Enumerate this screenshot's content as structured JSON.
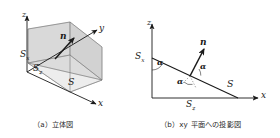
{
  "figure": {
    "type": "technical-diagram",
    "background_color": "#ffffff",
    "line_color": "#1a1a1a",
    "shade_color": "#d8d8d8",
    "panels": [
      {
        "id": "panel-a",
        "caption": "（a）立体図",
        "caption_label": "(a)",
        "caption_text": "立体図",
        "axes": [
          {
            "name": "x-axis",
            "label": "x"
          },
          {
            "name": "y-axis",
            "label": "y"
          },
          {
            "name": "z-axis",
            "label": "z"
          }
        ],
        "vectors": [
          {
            "name": "normal-vector",
            "label": "n"
          }
        ],
        "surfaces": [
          {
            "name": "surface-S",
            "label": "S"
          },
          {
            "name": "surface-Sx",
            "label": "S",
            "sub": "x"
          },
          {
            "name": "surface-Sz",
            "label": "S",
            "sub": "z"
          }
        ]
      },
      {
        "id": "panel-b",
        "caption": "（b）xy 平面への投影図",
        "caption_label": "(b)",
        "caption_text": "xy 平面への投影図",
        "axes": [
          {
            "name": "x-axis",
            "label": "x"
          },
          {
            "name": "z-axis",
            "label": "z"
          }
        ],
        "vectors": [
          {
            "name": "normal-vector",
            "label": "n"
          }
        ],
        "segments": [
          {
            "name": "segment-S",
            "label": "S"
          },
          {
            "name": "segment-Sx",
            "label": "S",
            "sub": "x"
          },
          {
            "name": "segment-Sz",
            "label": "S",
            "sub": "z"
          }
        ],
        "angles": [
          {
            "name": "angle-alpha-top",
            "label": "α"
          },
          {
            "name": "angle-alpha-right",
            "label": "α"
          },
          {
            "name": "angle-alpha-mid",
            "label": "α"
          }
        ]
      }
    ]
  },
  "labels": {
    "a": {
      "x": "x",
      "y": "y",
      "z": "z",
      "n": "n",
      "S": "S",
      "Sx_base": "S",
      "Sx_sub": "x",
      "Sz_base": "S",
      "Sz_sub": "z"
    },
    "b": {
      "x": "x",
      "z": "z",
      "n": "n",
      "S": "S",
      "Sx_base": "S",
      "Sx_sub": "x",
      "Sz_base": "S",
      "Sz_sub": "z",
      "alpha1": "α",
      "alpha2": "α",
      "alpha3": "α"
    }
  }
}
